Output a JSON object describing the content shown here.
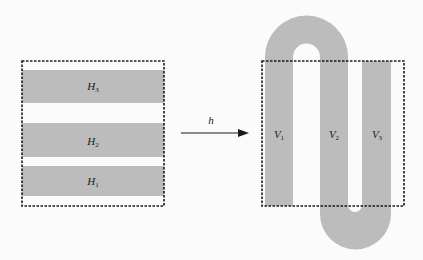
{
  "diagram": {
    "type": "map-transformation",
    "colors": {
      "background": "#fbfbfb",
      "strip_fill": "#bcbcbc",
      "box_border": "#1a1a1a",
      "text": "#1a1a1a"
    },
    "left_box": {
      "strips": [
        {
          "id": "H3",
          "label": "H",
          "sub": "3"
        },
        {
          "id": "H2",
          "label": "H",
          "sub": "2"
        },
        {
          "id": "H1",
          "label": "H",
          "sub": "1"
        }
      ]
    },
    "arrow": {
      "label": "h"
    },
    "right_box": {
      "strips": [
        {
          "id": "V1",
          "label": "V",
          "sub": "1"
        },
        {
          "id": "V2",
          "label": "V",
          "sub": "2"
        },
        {
          "id": "V3",
          "label": "V",
          "sub": "3"
        }
      ]
    }
  }
}
